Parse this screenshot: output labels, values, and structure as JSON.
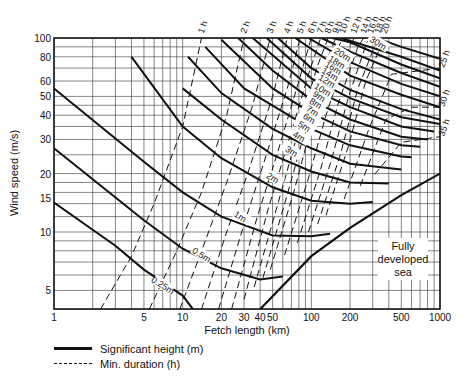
{
  "chart_data": {
    "type": "line",
    "title": "",
    "xlabel": "Fetch length (km)",
    "ylabel": "Wind speed (m/s)",
    "x_scale": "log",
    "y_scale": "log",
    "xlim": [
      1,
      1000
    ],
    "ylim": [
      4,
      100
    ],
    "grid": true,
    "x_ticks": [
      1,
      5,
      10,
      20,
      30,
      40,
      50,
      100,
      200,
      500,
      1000
    ],
    "y_ticks": [
      5,
      10,
      15,
      20,
      30,
      40,
      50,
      60,
      80,
      100
    ],
    "legend": [
      {
        "label": "Significant height (m)",
        "style": "solid"
      },
      {
        "label": "Min. duration (h)",
        "style": "dashed"
      }
    ],
    "annotation": "Fully developed sea",
    "height_series": [
      {
        "name": "0.25 m",
        "points": [
          [
            1,
            14.2
          ],
          [
            3,
            8.5
          ],
          [
            5,
            6.4
          ],
          [
            10,
            4.7
          ],
          [
            12,
            4.0
          ]
        ]
      },
      {
        "name": "0.5 m",
        "points": [
          [
            1,
            27
          ],
          [
            5,
            11.5
          ],
          [
            10,
            8.2
          ],
          [
            20,
            6.5
          ],
          [
            40,
            5.7
          ],
          [
            60,
            5.9
          ]
        ]
      },
      {
        "name": "1 m",
        "points": [
          [
            1,
            55
          ],
          [
            5,
            23
          ],
          [
            10,
            16
          ],
          [
            20,
            12
          ],
          [
            50,
            9.6
          ],
          [
            100,
            9.5
          ],
          [
            140,
            9.8
          ]
        ]
      },
      {
        "name": "2 m",
        "points": [
          [
            4,
            80
          ],
          [
            10,
            35
          ],
          [
            20,
            24
          ],
          [
            50,
            17
          ],
          [
            100,
            14.5
          ],
          [
            200,
            14
          ],
          [
            300,
            14.3
          ]
        ]
      },
      {
        "name": "3 m",
        "points": [
          [
            10,
            55
          ],
          [
            20,
            38
          ],
          [
            50,
            25
          ],
          [
            100,
            20.5
          ],
          [
            200,
            18
          ],
          [
            400,
            17.8
          ]
        ]
      },
      {
        "name": "4 m",
        "points": [
          [
            11,
            80
          ],
          [
            20,
            52
          ],
          [
            50,
            34
          ],
          [
            100,
            27
          ],
          [
            200,
            22.5
          ],
          [
            500,
            21
          ]
        ]
      },
      {
        "name": "5 m",
        "points": [
          [
            15,
            90
          ],
          [
            30,
            55
          ],
          [
            100,
            34
          ],
          [
            200,
            28
          ],
          [
            500,
            24.5
          ],
          [
            600,
            24.3
          ]
        ]
      },
      {
        "name": "6 m",
        "points": [
          [
            20,
            98
          ],
          [
            50,
            55
          ],
          [
            100,
            41
          ],
          [
            200,
            33
          ],
          [
            500,
            28
          ],
          [
            700,
            27.5
          ]
        ]
      },
      {
        "name": "7 m",
        "points": [
          [
            27,
            100
          ],
          [
            50,
            68
          ],
          [
            100,
            48
          ],
          [
            200,
            38
          ],
          [
            500,
            31
          ],
          [
            800,
            30
          ]
        ]
      },
      {
        "name": "8 m",
        "points": [
          [
            35,
            100
          ],
          [
            100,
            55
          ],
          [
            200,
            44
          ],
          [
            500,
            35
          ],
          [
            900,
            33
          ]
        ]
      },
      {
        "name": "9 m",
        "points": [
          [
            45,
            100
          ],
          [
            100,
            62
          ],
          [
            200,
            49
          ],
          [
            500,
            39
          ],
          [
            1000,
            36
          ]
        ]
      },
      {
        "name": "10 m",
        "points": [
          [
            55,
            100
          ],
          [
            100,
            70
          ],
          [
            200,
            54
          ],
          [
            500,
            43
          ],
          [
            1000,
            38
          ]
        ]
      },
      {
        "name": "12 m",
        "points": [
          [
            75,
            100
          ],
          [
            200,
            64
          ],
          [
            500,
            51
          ],
          [
            1000,
            44
          ]
        ]
      },
      {
        "name": "14 m",
        "points": [
          [
            95,
            100
          ],
          [
            200,
            75
          ],
          [
            500,
            58
          ],
          [
            1000,
            50
          ]
        ]
      },
      {
        "name": "16 m",
        "points": [
          [
            120,
            100
          ],
          [
            200,
            85
          ],
          [
            500,
            66
          ],
          [
            1000,
            56
          ]
        ]
      },
      {
        "name": "18 m",
        "points": [
          [
            145,
            100
          ],
          [
            200,
            95
          ],
          [
            500,
            73
          ],
          [
            1000,
            62
          ]
        ]
      },
      {
        "name": "20 m",
        "points": [
          [
            170,
            100
          ],
          [
            500,
            80
          ],
          [
            1000,
            68
          ]
        ]
      },
      {
        "name": "30 m",
        "points": [
          [
            320,
            100
          ],
          [
            500,
            90
          ],
          [
            1000,
            78
          ]
        ]
      }
    ],
    "duration_series": [
      {
        "name": "1 h",
        "points": [
          [
            2.3,
            4
          ],
          [
            4,
            7.5
          ],
          [
            6,
            14
          ],
          [
            10,
            35
          ],
          [
            14,
            100
          ]
        ]
      },
      {
        "name": "2 h",
        "points": [
          [
            5.5,
            4
          ],
          [
            9,
            8
          ],
          [
            14,
            16
          ],
          [
            22,
            40
          ],
          [
            30,
            100
          ]
        ]
      },
      {
        "name": "3 h",
        "points": [
          [
            9.5,
            4
          ],
          [
            15,
            9
          ],
          [
            22,
            18
          ],
          [
            35,
            45
          ],
          [
            48,
            100
          ]
        ]
      },
      {
        "name": "4 h",
        "points": [
          [
            14,
            4
          ],
          [
            22,
            10
          ],
          [
            32,
            20
          ],
          [
            50,
            50
          ],
          [
            65,
            100
          ]
        ]
      },
      {
        "name": "5 h",
        "points": [
          [
            19,
            4
          ],
          [
            30,
            11
          ],
          [
            42,
            22
          ],
          [
            65,
            55
          ],
          [
            82,
            100
          ]
        ]
      },
      {
        "name": "6 h",
        "points": [
          [
            24,
            4
          ],
          [
            38,
            12
          ],
          [
            54,
            25
          ],
          [
            80,
            60
          ],
          [
            100,
            100
          ]
        ]
      },
      {
        "name": "7 h",
        "points": [
          [
            30,
            4.5
          ],
          [
            46,
            13
          ],
          [
            64,
            27
          ],
          [
            95,
            65
          ],
          [
            118,
            100
          ]
        ]
      },
      {
        "name": "8 h",
        "points": [
          [
            36,
            5.2
          ],
          [
            55,
            14
          ],
          [
            76,
            30
          ],
          [
            110,
            70
          ],
          [
            135,
            100
          ]
        ]
      },
      {
        "name": "9 h",
        "points": [
          [
            42,
            5.8
          ],
          [
            64,
            15
          ],
          [
            88,
            32
          ],
          [
            130,
            75
          ],
          [
            155,
            100
          ]
        ]
      },
      {
        "name": "10 h",
        "points": [
          [
            48,
            6.4
          ],
          [
            73,
            16
          ],
          [
            100,
            35
          ],
          [
            150,
            80
          ],
          [
            175,
            100
          ]
        ]
      },
      {
        "name": "12 h",
        "points": [
          [
            62,
            7.6
          ],
          [
            95,
            19
          ],
          [
            130,
            40
          ],
          [
            190,
            85
          ],
          [
            215,
            100
          ]
        ]
      },
      {
        "name": "14 h",
        "points": [
          [
            78,
            8.8
          ],
          [
            118,
            21
          ],
          [
            160,
            45
          ],
          [
            230,
            90
          ],
          [
            255,
            100
          ]
        ]
      },
      {
        "name": "16 h",
        "points": [
          [
            95,
            10
          ],
          [
            142,
            23
          ],
          [
            195,
            50
          ],
          [
            270,
            95
          ],
          [
            290,
            100
          ]
        ]
      },
      {
        "name": "18 h",
        "points": [
          [
            112,
            11
          ],
          [
            168,
            25
          ],
          [
            230,
            55
          ],
          [
            330,
            100
          ]
        ]
      },
      {
        "name": "20 h",
        "points": [
          [
            130,
            12.2
          ],
          [
            195,
            28
          ],
          [
            265,
            60
          ],
          [
            370,
            100
          ]
        ]
      },
      {
        "name": "25 h",
        "points": [
          [
            180,
            14.8
          ],
          [
            280,
            34
          ],
          [
            420,
            65
          ],
          [
            1000,
            70
          ]
        ]
      },
      {
        "name": "30 h",
        "points": [
          [
            240,
            17.3
          ],
          [
            380,
            38
          ],
          [
            600,
            44
          ],
          [
            1000,
            44
          ]
        ]
      },
      {
        "name": "35 h",
        "points": [
          [
            310,
            19.8
          ],
          [
            500,
            29
          ],
          [
            1000,
            31
          ]
        ]
      }
    ],
    "fully_developed_boundary": [
      [
        40,
        4
      ],
      [
        100,
        7.5
      ],
      [
        200,
        10.5
      ],
      [
        500,
        15.5
      ],
      [
        1000,
        20
      ]
    ],
    "top_labels": [
      "1 h",
      "2 h",
      "3 h",
      "4 h",
      "5 h",
      "6 h",
      "7 h",
      "8 h",
      "9 h",
      "10 h",
      "12 h",
      "14 h",
      "16 h",
      "18 h",
      "20 h"
    ],
    "right_labels": [
      "25 h",
      "30 h",
      "35 h"
    ]
  },
  "labels": {
    "x_axis": "Fetch length (km)",
    "y_axis": "Wind speed (m/s)",
    "legend_solid": "Significant height (m)",
    "legend_dashed": "Min. duration (h)",
    "annotation_line1": "Fully",
    "annotation_line2": "developed",
    "annotation_line3": "sea"
  }
}
